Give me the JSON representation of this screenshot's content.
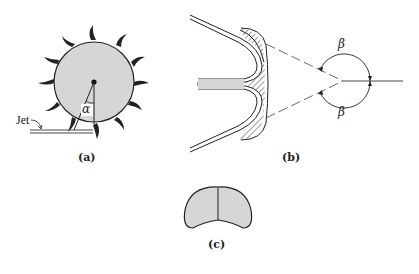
{
  "figure": {
    "panels": [
      {
        "id": "a",
        "label": "(a)",
        "annotations": {
          "jet": "Jet",
          "angle": "α"
        }
      },
      {
        "id": "b",
        "label": "(b)",
        "annotations": {
          "angle_top": "β",
          "angle_bottom": "β"
        }
      },
      {
        "id": "c",
        "label": "(c)"
      }
    ],
    "colors": {
      "fill": "#d6d6d6",
      "stroke": "#222222",
      "background": "#ffffff"
    }
  }
}
